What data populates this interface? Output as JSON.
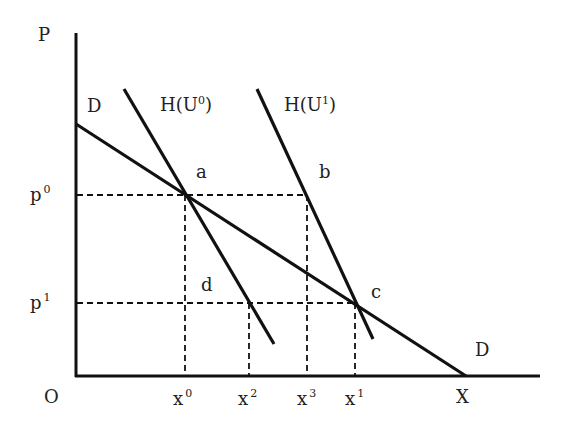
{
  "diagram": {
    "axes": {
      "y_label": "P",
      "x_label": "X",
      "origin_label": "O"
    },
    "curves": {
      "demand_left": "D",
      "demand_right": "D",
      "hicks0": {
        "base": "H(U",
        "sup": "0",
        "close": ")"
      },
      "hicks1": {
        "base": "H(U",
        "sup": "1",
        "close": ")"
      }
    },
    "points": {
      "a": "a",
      "b": "b",
      "c": "c",
      "d": "d"
    },
    "price_ticks": [
      {
        "base": "p",
        "sup": "0"
      },
      {
        "base": "p",
        "sup": "1"
      }
    ],
    "quantity_ticks": [
      {
        "base": "x",
        "sup": "0"
      },
      {
        "base": "x",
        "sup": "2"
      },
      {
        "base": "x",
        "sup": "3"
      },
      {
        "base": "x",
        "sup": "1"
      }
    ]
  }
}
